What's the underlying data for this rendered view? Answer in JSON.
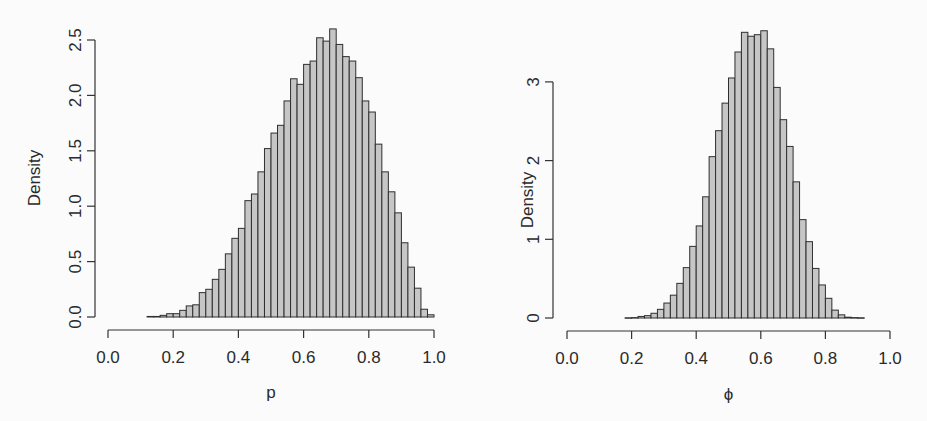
{
  "colors": {
    "bar_fill": "#c6c6c6",
    "bar_stroke": "#2f2f2f",
    "axis": "#333333",
    "text": "#2a2a2a"
  },
  "chart_data": [
    {
      "type": "bar",
      "subtype": "histogram",
      "title": "",
      "xlabel": "p",
      "ylabel": "Density",
      "xlim": [
        0.0,
        1.0
      ],
      "ylim": [
        0.0,
        2.6
      ],
      "xticks": [
        "0.0",
        "0.2",
        "0.4",
        "0.6",
        "0.8",
        "1.0"
      ],
      "yticks": [
        "0.0",
        "0.5",
        "1.0",
        "1.5",
        "2.0",
        "2.5"
      ],
      "bin_width": 0.02,
      "bin_start": 0.12,
      "values": [
        0.005,
        0.005,
        0.015,
        0.03,
        0.03,
        0.06,
        0.1,
        0.11,
        0.22,
        0.25,
        0.34,
        0.43,
        0.57,
        0.71,
        0.8,
        1.05,
        1.11,
        1.31,
        1.52,
        1.66,
        1.73,
        1.95,
        2.15,
        2.1,
        2.28,
        2.31,
        2.52,
        2.49,
        2.6,
        2.46,
        2.35,
        2.31,
        2.16,
        1.95,
        1.85,
        1.56,
        1.31,
        1.13,
        0.94,
        0.67,
        0.45,
        0.26,
        0.07,
        0.02
      ],
      "grid": false,
      "legend": null
    },
    {
      "type": "bar",
      "subtype": "histogram",
      "title": "",
      "xlabel": "ϕ",
      "ylabel": "Density",
      "xlim": [
        0.0,
        1.0
      ],
      "ylim": [
        0,
        3.7
      ],
      "xticks": [
        "0.0",
        "0.2",
        "0.4",
        "0.6",
        "0.8",
        "1.0"
      ],
      "yticks": [
        "0",
        "1",
        "2",
        "3"
      ],
      "bin_width": 0.02,
      "bin_start": 0.18,
      "values": [
        0.003,
        0.005,
        0.02,
        0.03,
        0.06,
        0.11,
        0.19,
        0.29,
        0.44,
        0.64,
        0.91,
        1.17,
        1.54,
        2.05,
        2.38,
        2.73,
        3.05,
        3.38,
        3.63,
        3.58,
        3.6,
        3.65,
        3.42,
        2.93,
        2.52,
        2.18,
        1.73,
        1.25,
        0.97,
        0.63,
        0.42,
        0.25,
        0.1,
        0.04,
        0.01,
        0.005,
        0.003
      ],
      "grid": false,
      "legend": null
    }
  ],
  "layout": [
    {
      "x0": 108,
      "x1": 434,
      "xaxis_y": 330,
      "yaxis_x": 95,
      "y_zero": 317,
      "y_per_unit": 110.8,
      "ytick_vals": [
        0,
        0.5,
        1.0,
        1.5,
        2.0,
        2.5
      ],
      "ylabel_x": 40,
      "ylabel_y": 178,
      "xlabel_y": 398
    },
    {
      "x0": 567,
      "x1": 890,
      "xaxis_y": 331,
      "yaxis_x": 553,
      "y_zero": 318,
      "y_per_unit": 78.7,
      "ytick_vals": [
        0,
        1,
        2,
        3
      ],
      "ylabel_x": 533,
      "ylabel_y": 200,
      "xlabel_y": 400
    }
  ]
}
